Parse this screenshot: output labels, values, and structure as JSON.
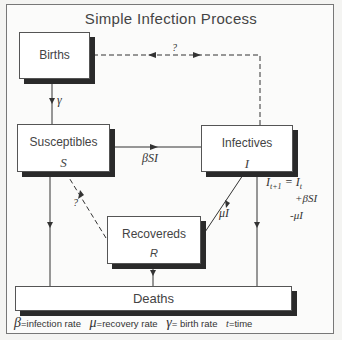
{
  "title": "Simple Infection Process",
  "nodes": {
    "births": {
      "label": "Births"
    },
    "susceptibles": {
      "label": "Susceptibles",
      "var": "S"
    },
    "infectives": {
      "label": "Infectives",
      "var": "I"
    },
    "recovereds": {
      "label": "Recovereds",
      "var": "R"
    },
    "deaths": {
      "label": "Deaths"
    }
  },
  "edges": {
    "birth_to_s": "γ",
    "s_to_i": "βSI",
    "i_to_r": "μI",
    "r_to_s": "?",
    "i_to_births": "?"
  },
  "equation": {
    "line1": "I t+1 = I t",
    "line2": "+βSI",
    "line3": "-μI"
  },
  "legend": [
    {
      "symbol": "β",
      "text": "=infection rate"
    },
    {
      "symbol": "μ",
      "text": "=recovery rate"
    },
    {
      "symbol": "γ",
      "text": "= birth rate"
    },
    {
      "symbol": "t",
      "text": "=time"
    }
  ]
}
